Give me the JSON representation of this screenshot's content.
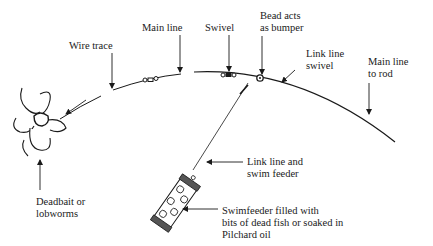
{
  "diagram": {
    "type": "fishing-rig-illustration",
    "ink_color": "#1a1a1a",
    "labels": {
      "wire_trace": [
        "Wire trace"
      ],
      "main_line": [
        "Main line"
      ],
      "swivel": [
        "Swivel"
      ],
      "bead": [
        "Bead acts",
        "as bumper"
      ],
      "link_swivel": [
        "Link line",
        "swivel"
      ],
      "main_to_rod": [
        "Main line",
        "to rod"
      ],
      "deadbait": [
        "Deadbait or",
        "lobworms"
      ],
      "link_feeder": [
        "Link line and",
        "swim feeder"
      ],
      "swimfeeder": [
        "Swimfeeder filled with",
        "bits of dead fish or soaked in",
        "Pilchard oil"
      ]
    }
  }
}
